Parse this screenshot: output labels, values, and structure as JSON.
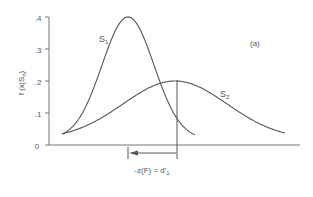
{
  "chart_data": {
    "type": "line",
    "title": "",
    "panel_label": "(a)",
    "xlabel": "",
    "ylabel": "f (x|Sₙ)",
    "ylabel_main": "f (x|S",
    "ylabel_sub": "n",
    "ylabel_close": ")",
    "ylim": [
      0,
      0.4
    ],
    "yticks": [
      0,
      0.1,
      0.2,
      0.3,
      0.4
    ],
    "ytick_labels": [
      "0",
      ".1",
      ".2",
      ".3",
      ".4"
    ],
    "xticks": [],
    "grid": false,
    "legend": "none (inline curve labels)",
    "series": [
      {
        "name": "S1",
        "label_main": "S",
        "label_sub": "1",
        "distribution": "normal",
        "peak_y": 0.4,
        "peak_x_px": 128,
        "start_x_px": 62,
        "end_x_px": 195,
        "color": "#555555"
      },
      {
        "name": "S2",
        "label_main": "S",
        "label_sub": "2",
        "distribution": "normal",
        "peak_y": 0.2,
        "peak_x_px": 175,
        "start_x_px": 62,
        "end_x_px": 285,
        "color": "#555555"
      }
    ],
    "annotations": [
      {
        "type": "vertical-line",
        "description": "decision criterion",
        "x_px": 177
      },
      {
        "type": "arrow",
        "description": "distance from criterion to S1 mean",
        "from_x_px": 177,
        "to_x_px": 128,
        "text": "-z(F) = d'₁",
        "text_main": "-z(F) = d'",
        "text_sub": "1"
      }
    ]
  }
}
